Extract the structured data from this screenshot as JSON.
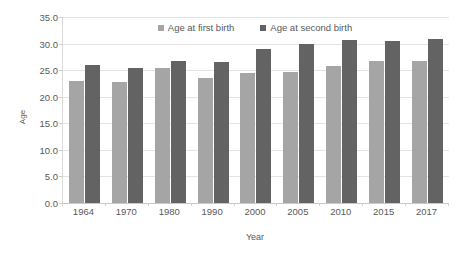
{
  "chart_data": {
    "type": "bar",
    "title": "",
    "xlabel": "Year",
    "ylabel": "Age",
    "categories": [
      "1964",
      "1970",
      "1980",
      "1990",
      "2000",
      "2005",
      "2010",
      "2015",
      "2017"
    ],
    "series": [
      {
        "name": "Age at first birth",
        "color": "#a5a5a5",
        "values": [
          23.0,
          22.8,
          25.4,
          23.6,
          24.5,
          24.7,
          25.8,
          26.7,
          26.8
        ]
      },
      {
        "name": "Age at second birth",
        "color": "#636363",
        "values": [
          26.0,
          25.4,
          26.8,
          26.6,
          28.9,
          30.0,
          30.6,
          30.5,
          30.9
        ]
      }
    ],
    "ylim": [
      0.0,
      35.0
    ],
    "ytick_step": 5.0,
    "ytick_labels": [
      "0.0",
      "5.0",
      "10.0",
      "15.0",
      "20.0",
      "25.0",
      "30.0",
      "35.0"
    ],
    "grid": true,
    "legend_position": "top-center"
  },
  "legend": {
    "items": [
      {
        "label": "Age at first birth",
        "color": "#a5a5a5",
        "swatch_icon": "legend-square-icon"
      },
      {
        "label": "Age at second birth",
        "color": "#636363",
        "swatch_icon": "legend-square-icon"
      }
    ]
  },
  "axes": {
    "y_title": "Age",
    "x_title": "Year"
  },
  "colors": {
    "series_first": "#a5a5a5",
    "series_second": "#636363",
    "gridline": "#e4e4e4",
    "axis": "#d9d9d9",
    "text": "#595959",
    "background": "#ffffff"
  }
}
